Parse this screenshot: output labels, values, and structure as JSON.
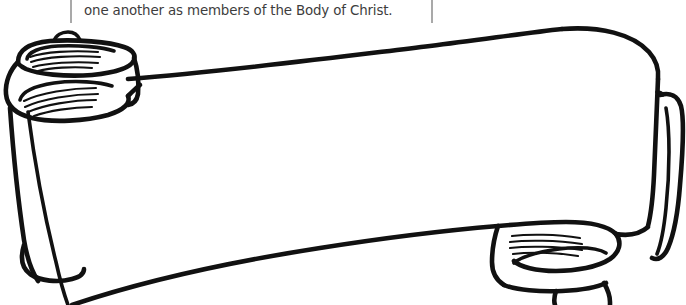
{
  "page": {
    "background_color": "#ffffff",
    "width": 686,
    "height": 305
  },
  "caption": {
    "text": "one another as members of the Body of Christ.",
    "color": "#3d3d3d",
    "rule_color": "#a9a9a9",
    "left_rule_name": "column-rule-left",
    "right_rule_name": "column-rule-right"
  },
  "artwork": {
    "name": "ribbon-banner-outline",
    "type": "line-art",
    "description": "Blank scroll banner with curled ends, drawn in black outline on white, coloring-book style",
    "ink_color": "#111111",
    "fill_color": "#ffffff",
    "parts": [
      {
        "name": "left-curl",
        "label": "left curled ribbon end"
      },
      {
        "name": "banner-body",
        "label": "main blank banner panel"
      },
      {
        "name": "right-curl",
        "label": "right curled ribbon end"
      },
      {
        "name": "right-fold",
        "label": "right side fold flap"
      },
      {
        "name": "left-tail",
        "label": "left descending tail"
      },
      {
        "name": "bottom-tail",
        "label": "lower sweeping tail"
      }
    ]
  }
}
